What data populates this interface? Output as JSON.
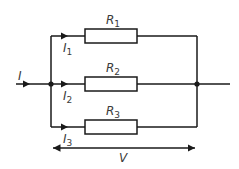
{
  "diagram": {
    "type": "parallel resistor circuit",
    "colors": {
      "wire": "#1a1a1a",
      "label": "#3a3a3a",
      "background": "#ffffff"
    },
    "input_current": {
      "symbol": "I"
    },
    "branches": [
      {
        "resistor": {
          "symbol": "R",
          "subscript": "1"
        },
        "current": {
          "symbol": "I",
          "subscript": "1"
        }
      },
      {
        "resistor": {
          "symbol": "R",
          "subscript": "2"
        },
        "current": {
          "symbol": "I",
          "subscript": "2"
        }
      },
      {
        "resistor": {
          "symbol": "R",
          "subscript": "3"
        },
        "current": {
          "symbol": "I",
          "subscript": "3"
        }
      }
    ],
    "voltage": {
      "symbol": "V"
    }
  }
}
